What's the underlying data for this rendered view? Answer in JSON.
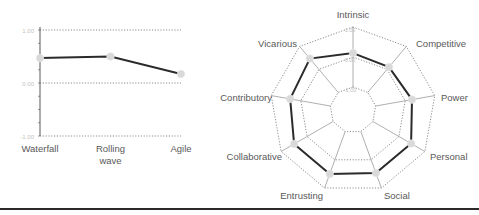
{
  "chart_data": [
    {
      "type": "line",
      "title": "",
      "xlabel": "",
      "ylabel": "",
      "categories": [
        "Waterfall",
        "Rolling wave",
        "Agile"
      ],
      "category_lines": [
        [
          "Waterfall"
        ],
        [
          "Rolling",
          "wave"
        ],
        [
          "Agile"
        ]
      ],
      "values": [
        0.47,
        0.5,
        0.17
      ],
      "ylim": [
        -1.0,
        1.0
      ],
      "yticks": [
        1.0,
        0.0,
        -1.0
      ],
      "ytick_labels": [
        "1.00",
        "0.00",
        "-1.00"
      ],
      "grid": "dotted horizontal",
      "legend": "none"
    },
    {
      "type": "radar",
      "title": "",
      "axes": [
        "Intrinsic",
        "Competitive",
        "Power",
        "Personal",
        "Social",
        "Entrusting",
        "Collaborative",
        "Contributory",
        "Vicarious"
      ],
      "values": [
        0.13,
        0.1,
        0.23,
        0.47,
        0.47,
        0.5,
        0.5,
        0.36,
        0.47
      ],
      "range": [
        -1.0,
        1.0
      ],
      "rings": [
        -1.0,
        0.0,
        1.0
      ],
      "ring_labels": [
        "-1.00",
        "0.00",
        "1.00"
      ],
      "grid": "dotted polygon rings",
      "legend": "none"
    }
  ],
  "colors": {
    "series_line": "#2b2b2b",
    "marker": "#d9d9d9",
    "grid": "#8c8c8c",
    "axis": "#a6a6a6",
    "label": "#595959",
    "tick_label": "#bfbfbf",
    "separator": "#2a2a2a"
  }
}
